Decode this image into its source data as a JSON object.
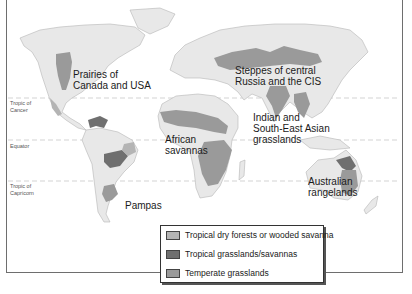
{
  "map": {
    "latitude_lines": [
      {
        "label": "Tropic of\nCancer",
        "line1": "Tropic of",
        "line2": "Cancer"
      },
      {
        "label": "Equator"
      },
      {
        "label": "Tropic of\nCapricorn",
        "line1": "Tropic of",
        "line2": "Capricorn"
      }
    ],
    "regions": [
      {
        "label_line1": "Prairies of",
        "label_line2": "Canada and USA"
      },
      {
        "label_line1": "Steppes of central",
        "label_line2": "Russia and the CIS"
      },
      {
        "label_line1": "African",
        "label_line2": "savannas"
      },
      {
        "label_line1": "Indian and",
        "label_line2": "South-East Asian",
        "label_line3": "grasslands"
      },
      {
        "label_line1": "Australian",
        "label_line2": "rangelands"
      },
      {
        "label_line1": "Pampas"
      }
    ],
    "colors": {
      "land": "#e8e8e8",
      "land_outline": "#b5b5b5",
      "tropical_dry": "#b4b4b4",
      "tropical_grass": "#6f6f6f",
      "temperate": "#9a9a9a",
      "lat_line": "#c8c8c8"
    }
  },
  "legend": {
    "items": [
      {
        "label": "Tropical dry forests or wooded savanna",
        "color": "#b4b4b4"
      },
      {
        "label": "Tropical grasslands/savannas",
        "color": "#6f6f6f"
      },
      {
        "label": "Temperate grasslands",
        "color": "#9a9a9a"
      }
    ]
  }
}
